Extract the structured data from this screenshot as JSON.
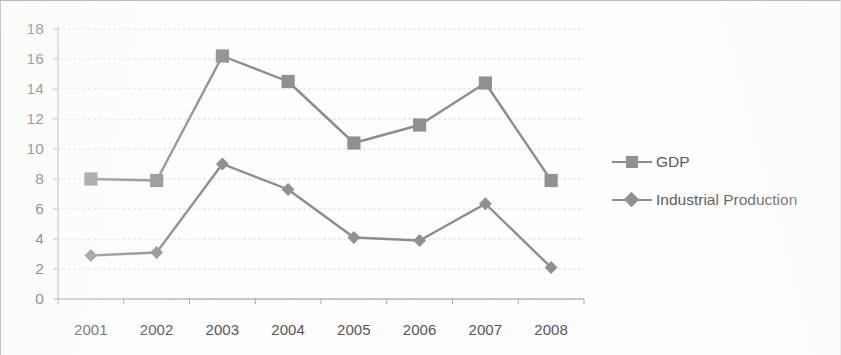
{
  "chart_data": {
    "type": "line",
    "title": "",
    "subtitle": "",
    "xlabel": "",
    "ylabel": "",
    "categories": [
      "2001",
      "2002",
      "2003",
      "2004",
      "2005",
      "2006",
      "2007",
      "2008"
    ],
    "series": [
      {
        "name": "GDP",
        "marker": "square",
        "color": "#8c8c8c",
        "values": [
          8.0,
          7.9,
          16.2,
          14.5,
          10.4,
          11.6,
          14.4,
          7.9
        ]
      },
      {
        "name": "Industrial Production",
        "marker": "diamond",
        "color": "#8c8c8c",
        "values": [
          2.9,
          3.1,
          9.0,
          7.3,
          4.1,
          3.9,
          6.35,
          2.1
        ]
      }
    ],
    "ylim": [
      0,
      18
    ],
    "ytick_step": 2,
    "yticks": [
      "18",
      "16",
      "14",
      "12",
      "10",
      "8",
      "6",
      "4",
      "2",
      "0"
    ],
    "xticks": [
      "2001",
      "2002",
      "2003",
      "2004",
      "2005",
      "2006",
      "2007",
      "2008"
    ],
    "grid": true,
    "grid_axis": "y",
    "legend_position": "right",
    "legend": [
      "GDP",
      "Industrial Production"
    ]
  },
  "colors": {
    "line": "#8c8c8c",
    "marker": "#909090",
    "gridline": "#d9dde3",
    "axis": "#a9a9a9",
    "tick_text": "#57565a",
    "background": "#fdfdfd"
  }
}
